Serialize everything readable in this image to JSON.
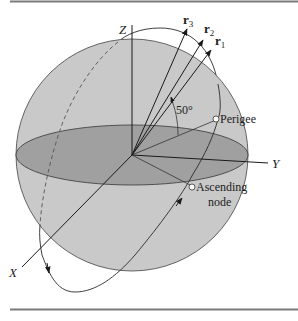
{
  "figure": {
    "axes": {
      "x_label": "X",
      "y_label": "Y",
      "z_label": "Z"
    },
    "vectors": [
      {
        "name": "r",
        "subscript": "3"
      },
      {
        "name": "r",
        "subscript": "2"
      },
      {
        "name": "r",
        "subscript": "1"
      }
    ],
    "angle_label": "50°",
    "points": {
      "perigee": "Perigee",
      "ascending_node_line1": "Ascending",
      "ascending_node_line2": "node"
    },
    "colors": {
      "sphere_fill": "#c8c8c8",
      "equator_fill": "#9e9e9e",
      "line": "#2a2a2a",
      "rule": "#808080"
    }
  }
}
